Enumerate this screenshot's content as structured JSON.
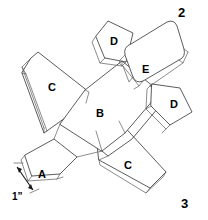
{
  "figure": {
    "background_color": "#ffffff",
    "line_color": "#4a4a4a",
    "text_color": "#000000"
  },
  "figure_numbers": [
    {
      "name": "figure-number-top-right",
      "label": "2",
      "x": 178,
      "y": 6
    },
    {
      "name": "figure-number-bottom-right",
      "label": "3",
      "x": 181,
      "y": 197
    }
  ],
  "part_labels": [
    {
      "name": "part-label-c-left-wing",
      "label": "C",
      "x": 48,
      "y": 82
    },
    {
      "name": "part-label-d-upper-fin",
      "label": "D",
      "x": 110,
      "y": 36
    },
    {
      "name": "part-label-e-stabilizer",
      "label": "E",
      "x": 142,
      "y": 64
    },
    {
      "name": "part-label-b-fuselage",
      "label": "B",
      "x": 96,
      "y": 108
    },
    {
      "name": "part-label-d-right-fin",
      "label": "D",
      "x": 170,
      "y": 99
    },
    {
      "name": "part-label-c-right-wing",
      "label": "C",
      "x": 124,
      "y": 160
    },
    {
      "name": "part-label-a-nose",
      "label": "A",
      "x": 38,
      "y": 169
    }
  ],
  "dimension": {
    "name": "width-dimension-callout",
    "label": "1”",
    "label_x": 12,
    "label_y": 192
  }
}
